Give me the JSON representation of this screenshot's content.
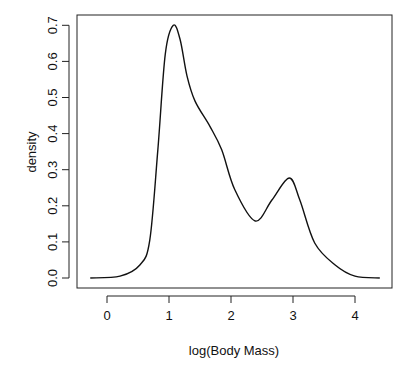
{
  "chart_data": {
    "type": "line",
    "title": "",
    "xlabel": "log(Body Mass)",
    "ylabel": "density",
    "xlim": [
      -0.3,
      4.45
    ],
    "ylim": [
      0.0,
      0.72
    ],
    "grid": false,
    "legend": null,
    "x_ticks": [
      "0",
      "1",
      "2",
      "3",
      "4"
    ],
    "y_ticks": [
      "0.0",
      "0.1",
      "0.2",
      "0.3",
      "0.4",
      "0.5",
      "0.6",
      "0.7"
    ],
    "series": [
      {
        "name": "density",
        "x": [
          -0.27,
          0.21,
          0.53,
          0.69,
          0.82,
          0.94,
          1.07,
          1.18,
          1.29,
          1.42,
          1.66,
          1.85,
          2.06,
          2.39,
          2.66,
          2.94,
          3.11,
          3.35,
          3.68,
          4.0,
          4.4
        ],
        "y": [
          0.0,
          0.005,
          0.036,
          0.105,
          0.355,
          0.62,
          0.7,
          0.66,
          0.56,
          0.49,
          0.42,
          0.355,
          0.245,
          0.158,
          0.216,
          0.277,
          0.216,
          0.097,
          0.036,
          0.005,
          0.0
        ]
      }
    ]
  }
}
